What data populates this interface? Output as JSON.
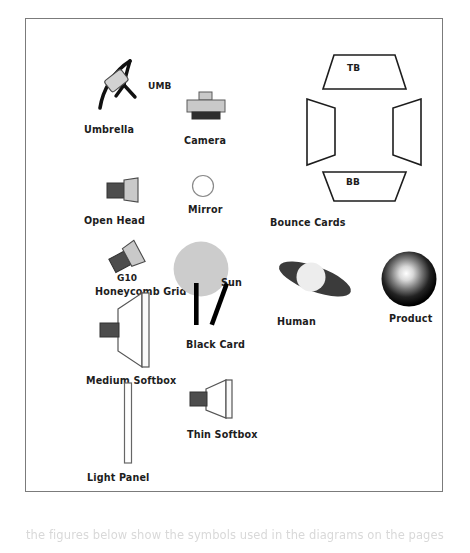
{
  "page": {
    "background_color": "#ffffff",
    "border_color": "#7b7b7b",
    "caption_cut_off": "the figures below show the symbols used in the diagrams on the pages that"
  },
  "palette": {
    "ink": "#1d1d1d",
    "line": "#555555",
    "light_gray": "#cfcfcf",
    "mid_gray": "#9a9a9a",
    "dark_gray": "#4a4a4a",
    "sun_gray": "#cccccc",
    "black": "#000000",
    "white": "#ffffff"
  },
  "symbols": [
    {
      "id": "umbrella",
      "name": "Umbrella",
      "label": "Umbrella",
      "badge": "UMB",
      "icon": "umbrella-reflector-icon",
      "description": "Curved black arc with light head on a stand"
    },
    {
      "id": "camera",
      "name": "Camera",
      "label": "Camera",
      "badge": "",
      "icon": "camera-icon",
      "description": "Gray camera body with viewfinder and dark lens base"
    },
    {
      "id": "open-head",
      "name": "Open Head",
      "label": "Open Head",
      "badge": "",
      "icon": "open-head-light-icon",
      "description": "Dark body with light gray open reflector head"
    },
    {
      "id": "mirror",
      "name": "Mirror",
      "label": "Mirror",
      "badge": "",
      "icon": "mirror-icon",
      "description": "Small white outlined circle"
    },
    {
      "id": "honeycomb-grid",
      "name": "Honeycomb Grid",
      "label": "Honeycomb Grid",
      "badge": "G10",
      "icon": "honeycomb-grid-icon",
      "description": "Rotated light head with grid, labelled G10"
    },
    {
      "id": "sun",
      "name": "Sun",
      "label": "Sun",
      "badge": "",
      "icon": "sun-icon",
      "description": "Large flat light gray disc"
    },
    {
      "id": "medium-softbox",
      "name": "Medium Softbox",
      "label": "Medium Softbox",
      "badge": "",
      "icon": "medium-softbox-icon",
      "description": "Dark stub with large white tapered box and front diffusion panel"
    },
    {
      "id": "black-card",
      "name": "Black Card",
      "label": "Black Card",
      "badge": "",
      "icon": "black-card-icon",
      "description": "Two solid black bars, one upright one tilted"
    },
    {
      "id": "light-panel",
      "name": "Light Panel",
      "label": "Light Panel",
      "badge": "",
      "icon": "light-panel-icon",
      "description": "Tall narrow white outlined rectangle"
    },
    {
      "id": "thin-softbox",
      "name": "Thin Softbox",
      "label": "Thin Softbox",
      "badge": "",
      "icon": "thin-softbox-icon",
      "description": "Dark stub with short tapered box and front panel"
    },
    {
      "id": "bounce-cards",
      "name": "Bounce Cards",
      "label": "Bounce Cards",
      "badge": "",
      "icon": "bounce-cards-icon",
      "description": "Four outlined trapezoid panels arranged around a subject",
      "panels": [
        {
          "id": "top",
          "label": "TB",
          "position": "top"
        },
        {
          "id": "left",
          "label": "",
          "position": "left"
        },
        {
          "id": "right",
          "label": "",
          "position": "right"
        },
        {
          "id": "bottom",
          "label": "BB",
          "position": "bottom"
        }
      ]
    },
    {
      "id": "human",
      "name": "Human",
      "label": "Human",
      "badge": "",
      "icon": "human-subject-icon",
      "description": "Dark tilted ellipse for shoulders with pale circle head"
    },
    {
      "id": "product",
      "name": "Product",
      "label": "Product",
      "badge": "",
      "icon": "product-sphere-icon",
      "description": "Sphere shaded from white highlight to black edge"
    }
  ]
}
